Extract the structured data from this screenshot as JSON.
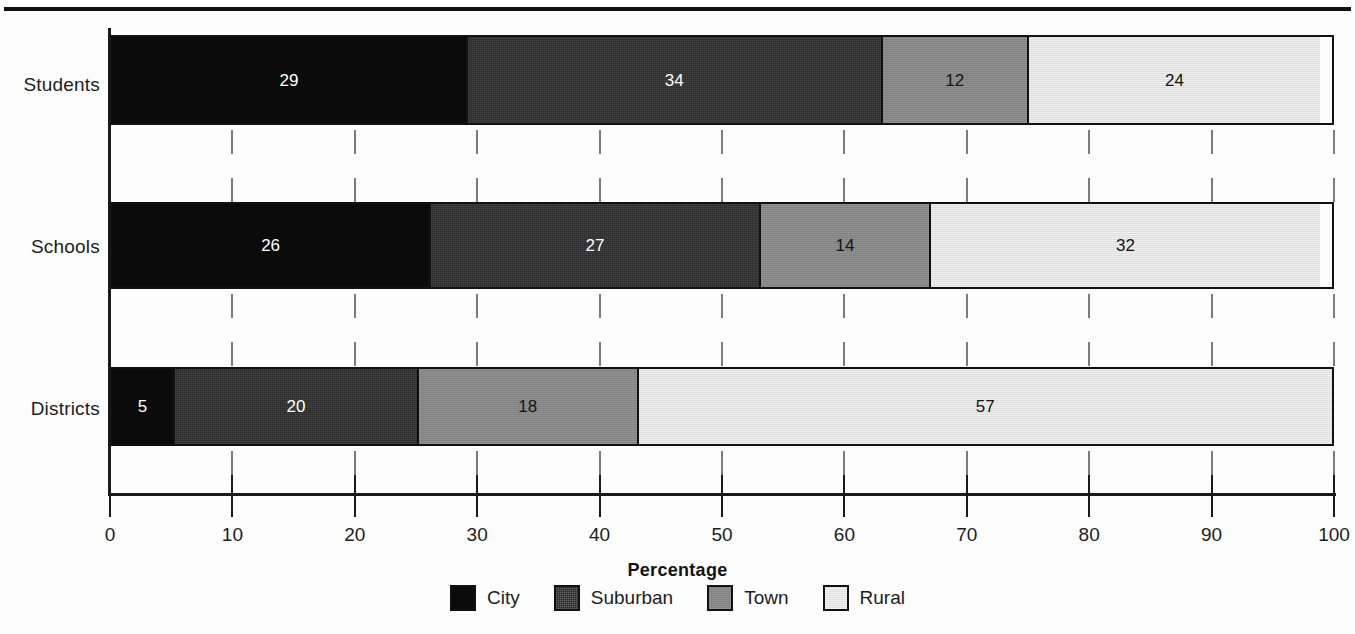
{
  "chart_data": {
    "type": "bar",
    "orientation": "horizontal",
    "stacked": true,
    "normalized": true,
    "title": "",
    "xlabel": "Percentage",
    "ylabel": "",
    "xlim": [
      0,
      100
    ],
    "xticks": [
      0,
      10,
      20,
      30,
      40,
      50,
      60,
      70,
      80,
      90,
      100
    ],
    "xtick_labels": [
      "0",
      "10",
      "20",
      "30",
      "40",
      "50",
      "60",
      "70",
      "80",
      "90",
      "100"
    ],
    "grid": false,
    "legend_position": "bottom",
    "categories": [
      "Students",
      "Schools",
      "Districts"
    ],
    "series": [
      {
        "name": "City",
        "color": "#0b0b0b",
        "values": [
          29,
          26,
          5
        ]
      },
      {
        "name": "Suburban",
        "color": "#2b2b2b",
        "values": [
          34,
          27,
          20
        ]
      },
      {
        "name": "Town",
        "color": "#868686",
        "values": [
          12,
          14,
          18
        ]
      },
      {
        "name": "Rural",
        "color": "#e2e2e2",
        "values": [
          24,
          32,
          57
        ]
      }
    ],
    "bar_labels": [
      [
        "29",
        "34",
        "12",
        "24"
      ],
      [
        "26",
        "27",
        "14",
        "32"
      ],
      [
        "5",
        "20",
        "18",
        "57"
      ]
    ]
  },
  "axis": {
    "title": "Percentage",
    "tick_labels": [
      "0",
      "10",
      "20",
      "30",
      "40",
      "50",
      "60",
      "70",
      "80",
      "90",
      "100"
    ]
  },
  "categories": [
    {
      "label": "Students"
    },
    {
      "label": "Schools"
    },
    {
      "label": "Districts"
    }
  ],
  "legend": {
    "items": [
      {
        "label": "City",
        "color": "#0b0b0b"
      },
      {
        "label": "Suburban",
        "color": "#2b2b2b"
      },
      {
        "label": "Town",
        "color": "#868686"
      },
      {
        "label": "Rural",
        "color": "#e2e2e2"
      }
    ]
  }
}
